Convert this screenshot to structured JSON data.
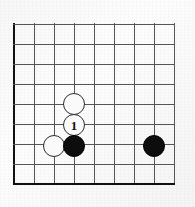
{
  "diagram": {
    "type": "go-board",
    "board": {
      "columns": 9,
      "rows": 9,
      "cell_size_px": 20,
      "origin_x_px": 14,
      "origin_y_px": 24,
      "line_color": "#555555",
      "edge_color": "#111111",
      "background_color": "#fbfbfb",
      "left_edge_is_border": true,
      "bottom_edge_is_border": true
    },
    "stones": [
      {
        "id": "white-upper",
        "color": "white",
        "col": 3,
        "row": 4,
        "x": 74,
        "y": 104,
        "radius": 11,
        "label": ""
      },
      {
        "id": "white-move-1",
        "color": "white",
        "col": 3,
        "row": 5,
        "x": 74,
        "y": 125,
        "radius": 11,
        "label": "1"
      },
      {
        "id": "white-left",
        "color": "white",
        "col": 2,
        "row": 6,
        "x": 54,
        "y": 146,
        "radius": 11,
        "label": ""
      },
      {
        "id": "black-center",
        "color": "black",
        "col": 3,
        "row": 6,
        "x": 74,
        "y": 146,
        "radius": 11,
        "label": ""
      },
      {
        "id": "black-right",
        "color": "black",
        "col": 7,
        "row": 6,
        "x": 154,
        "y": 146,
        "radius": 11,
        "label": ""
      }
    ],
    "move_numbers": [
      "1"
    ],
    "colors": {
      "black_stone": "#0d0d0d",
      "white_stone": "#fafafa",
      "white_stone_outline": "#2b2b2b",
      "grid": "#555555",
      "border": "#111111",
      "label_on_white": "#111111",
      "label_on_black": "#ffffff"
    }
  }
}
